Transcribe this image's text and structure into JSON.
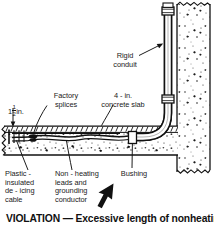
{
  "figure": {
    "type": "technical-cutaway-illustration",
    "caption": "VIOLATION — Excessive length of nonheating",
    "labels": {
      "dimension": {
        "whole": "1",
        "num": "1",
        "den": "2",
        "unit": "in."
      },
      "factory_splices": "Factory\nsplices",
      "concrete_slab": "4 - in.\nconcrete slab",
      "rigid_conduit": "Rigid\nconduit",
      "bushing": "Bushing",
      "deicing_cable": "Plastic -\ninsulated\nde - icing\ncable",
      "nonheating_leads": "Non - heating\nleads and\ngrounding\nconductor"
    },
    "colors": {
      "ink": "#1a1a1a",
      "paper": "#ffffff",
      "stipple": "#2a2a2a",
      "hatch": "#000000"
    }
  }
}
